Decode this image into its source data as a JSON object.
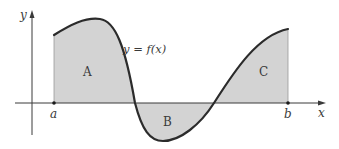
{
  "diagram": {
    "title": "",
    "type": "definite-integral-area",
    "function_label": "y = f(x)",
    "axes": {
      "x_label": "x",
      "y_label": "y"
    },
    "bounds": {
      "lower": "a",
      "upper": "b"
    },
    "regions": [
      {
        "label": "A",
        "sign": "positive"
      },
      {
        "label": "B",
        "sign": "negative"
      },
      {
        "label": "C",
        "sign": "positive"
      }
    ],
    "colors": {
      "fill": "#d3d3d3",
      "curve": "#2b2b2b",
      "axis": "#3a3a3a",
      "text": "#3a3a3a"
    }
  }
}
